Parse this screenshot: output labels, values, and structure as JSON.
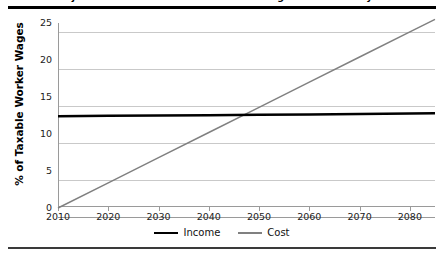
{
  "figure": {
    "title": "Projected Income and Cost as a Percentage of Taxable Payroll",
    "bottom_rule": ""
  },
  "chart_data": {
    "type": "line",
    "title": "Projected Income and Cost as a Percentage of Taxable Payroll",
    "xlabel": "",
    "ylabel": "% of Taxable Worker Wages",
    "xlim": [
      2010,
      2085
    ],
    "ylim": [
      0,
      25
    ],
    "xticks": [
      2010,
      2020,
      2030,
      2040,
      2050,
      2060,
      2070,
      2080
    ],
    "xtick_labels": [
      "2010",
      "2020",
      "2030",
      "2040",
      "2050",
      "2060",
      "2070",
      "2080"
    ],
    "yticks": [
      0,
      5,
      10,
      15,
      20,
      25
    ],
    "ytick_labels": [
      "0",
      "5",
      "10",
      "15",
      "20",
      "25"
    ],
    "grid": "horizontal",
    "legend_position": "bottom-center",
    "series": [
      {
        "name": "Income",
        "color": "#000000",
        "width": 2.5,
        "x": [
          2010,
          2020,
          2030,
          2040,
          2050,
          2060,
          2070,
          2080,
          2085
        ],
        "values": [
          12.4,
          12.45,
          12.5,
          12.55,
          12.6,
          12.65,
          12.7,
          12.78,
          12.8
        ]
      },
      {
        "name": "Cost",
        "color": "#808080",
        "width": 1.5,
        "x": [
          2010,
          2020,
          2030,
          2040,
          2050,
          2060,
          2070,
          2080,
          2085
        ],
        "values": [
          0.0,
          3.4,
          6.8,
          10.2,
          13.6,
          17.0,
          20.4,
          23.8,
          25.5
        ]
      }
    ],
    "annotations": [
      {
        "text": "crossover",
        "x": 2047,
        "y": 12.6
      }
    ]
  },
  "legend": {
    "items": [
      {
        "label": "Income"
      },
      {
        "label": "Cost"
      }
    ]
  }
}
